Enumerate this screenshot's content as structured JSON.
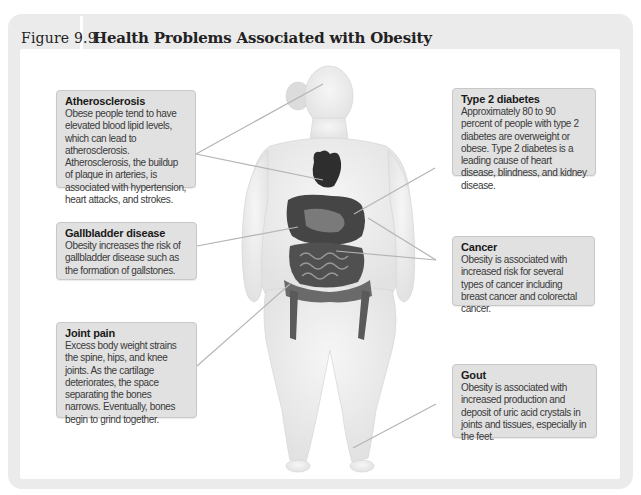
{
  "figure": {
    "number_label": "Figure 9.9",
    "title": "Health Problems Associated with Obesity"
  },
  "colors": {
    "frame_bg": "#ebebeb",
    "callout_bg": "#e1e1e1",
    "leader_line": "#b4b4b4",
    "body_silhouette": "#eeeeee",
    "organs": "#3a3a3a"
  },
  "callouts": {
    "atherosclerosis": {
      "title": "Atherosclerosis",
      "body": "Obese people tend to have elevated blood lipid levels, which can lead to atherosclerosis. Atherosclerosis, the buildup of plaque in arteries, is associated with hypertension, heart attacks, and strokes."
    },
    "type2_diabetes": {
      "title": "Type 2 diabetes",
      "body": "Approximately 80 to 90 percent of people with type 2 diabetes are overweight or obese. Type 2 diabetes is a leading cause of heart disease, blindness, and kidney disease."
    },
    "gallbladder": {
      "title": "Gallbladder disease",
      "body": "Obesity increases the risk of gallbladder disease such as the formation of gallstones."
    },
    "cancer": {
      "title": "Cancer",
      "body": "Obesity is associated with increased risk for several types of cancer including breast cancer and colorectal cancer."
    },
    "joint_pain": {
      "title": "Joint pain",
      "body": "Excess body weight strains the spine, hips, and knee joints. As the cartilage deteriorates, the space separating the bones narrows. Eventually, bones begin to grind together."
    },
    "gout": {
      "title": "Gout",
      "body": "Obesity is associated with increased production and deposit of uric acid crystals in joints and tissues, especially in the feet."
    }
  }
}
